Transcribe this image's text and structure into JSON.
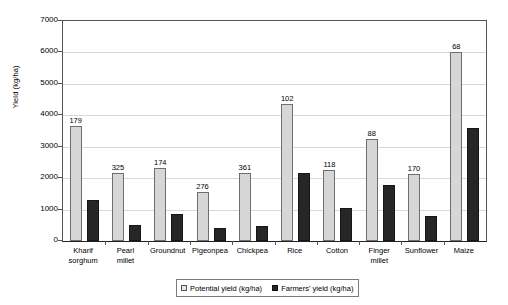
{
  "chart_data": {
    "type": "bar",
    "title": "",
    "subtitle": "",
    "xlabel": "",
    "ylabel": "Yield (kg/ha)",
    "ylim": [
      0,
      7000
    ],
    "yticks": [
      0,
      1000,
      2000,
      3000,
      4000,
      5000,
      6000,
      7000
    ],
    "ytick_labels": [
      "0",
      "1000",
      "2000",
      "3000",
      "4000",
      "5000",
      "6000",
      "7000"
    ],
    "grid": "horizontal",
    "legend_position": "bottom-center",
    "categories": [
      "Kharif\nsorghum",
      "Pearl\nmillet",
      "Groundnut",
      "Pigeonpea",
      "Chickpea",
      "Rice",
      "Cotton",
      "Finger\nmillet",
      "Sunflower",
      "Maize"
    ],
    "series": [
      {
        "name": "Potential yield (kg/ha)",
        "color": "#d6d6d6",
        "values": [
          3660,
          2180,
          2320,
          1550,
          2180,
          4350,
          2270,
          3250,
          2130,
          6000
        ]
      },
      {
        "name": "Farmers' yield (kg/ha)",
        "color": "#262626",
        "values": [
          1300,
          520,
          850,
          410,
          490,
          2170,
          1060,
          1780,
          790,
          3600
        ]
      }
    ],
    "annotations": {
      "description": "Number above each potential-yield bar",
      "values": [
        "179",
        "325",
        "174",
        "276",
        "361",
        "102",
        "118",
        "88",
        "170",
        "68"
      ]
    }
  },
  "legend": {
    "entries": [
      {
        "label": "Potential yield (kg/ha)"
      },
      {
        "label": "Farmers' yield (kg/ha)"
      }
    ]
  }
}
